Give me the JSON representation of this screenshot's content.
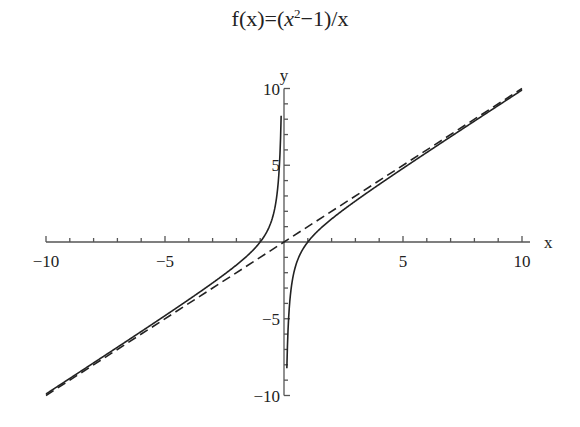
{
  "chart_data": {
    "type": "line",
    "title_parts": {
      "pre": "f(x)=(",
      "var": "x",
      "sup": "2",
      "post": "−1)/x"
    },
    "xlabel": "x",
    "ylabel": "y",
    "xlim": [
      -10,
      10
    ],
    "ylim": [
      -10,
      10
    ],
    "x_ticks": [
      "−10",
      "−5",
      "5",
      "10"
    ],
    "y_ticks": [
      "10",
      "5",
      "−5",
      "−10"
    ],
    "grid": false,
    "series": [
      {
        "name": "f(x)=(x^2-1)/x",
        "style": "solid",
        "x": [
          -10,
          -5,
          -2,
          -1,
          -0.5,
          -0.2,
          -0.1,
          0.1,
          0.2,
          0.5,
          1,
          2,
          5,
          10
        ],
        "values": [
          -9.9,
          -4.8,
          -1.5,
          0,
          1.5,
          4.8,
          9.9,
          -9.9,
          -4.8,
          -1.5,
          0,
          1.5,
          4.8,
          9.9
        ]
      },
      {
        "name": "asymptote y=x",
        "style": "dashed",
        "x": [
          -10,
          10
        ],
        "values": [
          -10,
          10
        ]
      }
    ]
  }
}
